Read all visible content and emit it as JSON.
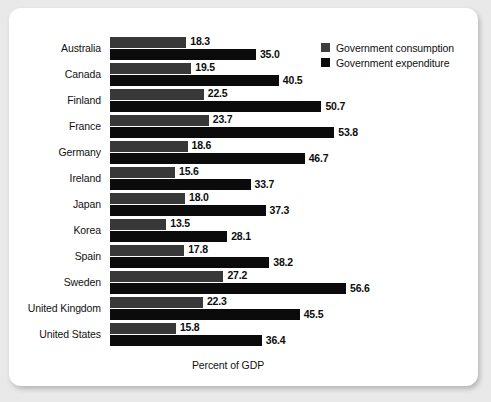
{
  "chart_data": {
    "type": "bar",
    "orientation": "horizontal",
    "title": "",
    "xlabel": "Percent of GDP",
    "ylabel": "",
    "xlim": [
      0,
      60
    ],
    "grid": false,
    "legend_position": "top-right",
    "categories": [
      "Australia",
      "Canada",
      "Finland",
      "France",
      "Germany",
      "Ireland",
      "Japan",
      "Korea",
      "Spain",
      "Sweden",
      "United Kingdom",
      "United States"
    ],
    "series": [
      {
        "name": "Government consumption",
        "color": "#383838",
        "values": [
          18.3,
          19.5,
          22.5,
          23.7,
          18.6,
          15.6,
          18.0,
          13.5,
          17.8,
          27.2,
          22.3,
          15.8
        ],
        "labels": [
          "18.3",
          "19.5",
          "22.5",
          "23.7",
          "18.6",
          "15.6",
          "18.0",
          "13.5",
          "17.8",
          "27.2",
          "22.3",
          "15.8"
        ]
      },
      {
        "name": "Government expenditure",
        "color": "#0b0b0b",
        "values": [
          35.0,
          40.5,
          50.7,
          53.8,
          46.7,
          33.7,
          37.3,
          28.1,
          38.2,
          56.6,
          45.5,
          36.4
        ],
        "labels": [
          "35.0",
          "40.5",
          "50.7",
          "53.8",
          "46.7",
          "33.7",
          "37.3",
          "28.1",
          "38.2",
          "56.6",
          "45.5",
          "36.4"
        ]
      }
    ]
  },
  "legend": {
    "items": [
      {
        "label": "Government consumption"
      },
      {
        "label": "Government expenditure"
      }
    ]
  },
  "axis": {
    "x_title": "Percent of GDP"
  }
}
